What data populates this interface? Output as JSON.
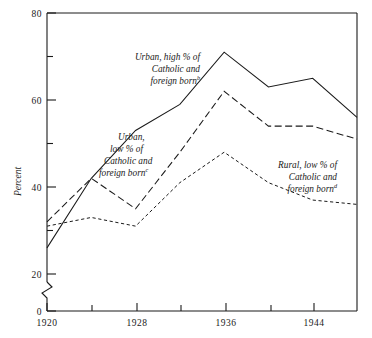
{
  "chart_data": {
    "type": "line",
    "title": "",
    "subtitle": "",
    "xlabel": "",
    "ylabel": "Percent",
    "xlim": [
      1920,
      1948
    ],
    "ylim": [
      0,
      80
    ],
    "grid": false,
    "legend_position": "inline-annotations",
    "axis_break": {
      "between": [
        0,
        20
      ],
      "note": "broken y-axis below 20"
    },
    "x_tick_labels": [
      "1920",
      "1928",
      "1936",
      "1944"
    ],
    "x_tick_values": [
      1920,
      1928,
      1936,
      1944
    ],
    "x_minor_tick_values": [
      1924,
      1932,
      1940
    ],
    "y_tick_labels": [
      "80",
      "60",
      "40",
      "20",
      "0"
    ],
    "y_tick_values": [
      80,
      60,
      40,
      20,
      0
    ],
    "y_minor_tick_values": [
      70,
      50,
      30
    ],
    "x": [
      1920,
      1924,
      1928,
      1932,
      1936,
      1940,
      1944,
      1948
    ],
    "series": [
      {
        "name": "Urban, high % of Catholic and foreign born",
        "footnote": "b",
        "style": "solid",
        "values": [
          26,
          42,
          53,
          59,
          71,
          63,
          65,
          56
        ]
      },
      {
        "name": "Urban, low % of Catholic and foreign born",
        "footnote": "c",
        "style": "long-dash",
        "values": [
          32,
          42,
          35,
          48,
          62,
          54,
          54,
          51
        ]
      },
      {
        "name": "Rural, low % of Catholic and foreign born",
        "footnote": "d",
        "style": "short-dash",
        "values": [
          31,
          33,
          31,
          41,
          48,
          41,
          37,
          36
        ]
      }
    ],
    "annotations": [
      {
        "id": "urban-high",
        "lines": [
          "Urban, high % of",
          "Catholic and",
          "foreign born"
        ],
        "footnote": "b"
      },
      {
        "id": "urban-low",
        "lines": [
          "Urban,",
          "low % of",
          "Catholic and",
          "foreign born"
        ],
        "footnote": "c"
      },
      {
        "id": "rural-low",
        "lines": [
          "Rural, low % of",
          "Catholic and",
          "foreign born"
        ],
        "footnote": "d"
      }
    ]
  }
}
